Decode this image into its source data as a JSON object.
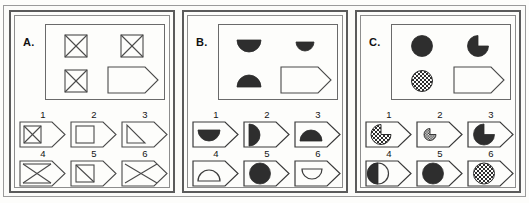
{
  "figure": {
    "type": "matrix-reasoning-test",
    "panel_count": 3,
    "options_per_panel": 6
  },
  "panels": [
    {
      "id": "A",
      "label": "A.",
      "matrix": {
        "cells": [
          {
            "position": "row1-col1",
            "shape": "square-with-x",
            "fill": "outline",
            "size": "medium"
          },
          {
            "position": "row1-col2",
            "shape": "square-with-x",
            "fill": "outline",
            "size": "medium"
          },
          {
            "position": "row2-col1",
            "shape": "square-with-x",
            "fill": "outline",
            "size": "medium"
          },
          {
            "position": "row2-col2",
            "shape": "pentagon-answer-slot",
            "fill": "empty",
            "size": "large"
          }
        ]
      },
      "options": [
        {
          "number": "1",
          "shape": "square-with-x",
          "fill": "outline",
          "size": "small",
          "inside": "pentagon-slot"
        },
        {
          "number": "2",
          "shape": "square-plain",
          "fill": "outline",
          "size": "small",
          "inside": "pentagon-slot"
        },
        {
          "number": "3",
          "shape": "right-triangle",
          "fill": "outline",
          "size": "small",
          "inside": "pentagon-slot"
        },
        {
          "number": "4",
          "shape": "bowtie-x",
          "fill": "outline",
          "size": "large",
          "inside": "pentagon-slot"
        },
        {
          "number": "5",
          "shape": "square-with-diagonal",
          "fill": "outline",
          "size": "small",
          "inside": "pentagon-slot"
        },
        {
          "number": "6",
          "shape": "large-x",
          "fill": "outline",
          "size": "large",
          "inside": "pentagon-slot"
        }
      ]
    },
    {
      "id": "B",
      "label": "B.",
      "matrix": {
        "cells": [
          {
            "position": "row1-col1",
            "shape": "semicircle-lower",
            "fill": "solid",
            "size": "medium"
          },
          {
            "position": "row1-col2",
            "shape": "semicircle-lower",
            "fill": "solid",
            "size": "small"
          },
          {
            "position": "row2-col1",
            "shape": "semicircle-upper",
            "fill": "solid",
            "size": "medium"
          },
          {
            "position": "row2-col2",
            "shape": "pentagon-answer-slot",
            "fill": "empty",
            "size": "large"
          }
        ]
      },
      "options": [
        {
          "number": "1",
          "shape": "semicircle-lower",
          "fill": "solid",
          "size": "small",
          "inside": "pentagon-slot"
        },
        {
          "number": "2",
          "shape": "half-circle-right",
          "fill": "solid",
          "size": "medium",
          "inside": "pentagon-slot"
        },
        {
          "number": "3",
          "shape": "semicircle-upper",
          "fill": "solid",
          "size": "small",
          "inside": "pentagon-slot"
        },
        {
          "number": "4",
          "shape": "semicircle-upper",
          "fill": "outline",
          "size": "small",
          "inside": "pentagon-slot"
        },
        {
          "number": "5",
          "shape": "circle",
          "fill": "solid",
          "size": "medium",
          "inside": "pentagon-slot"
        },
        {
          "number": "6",
          "shape": "semicircle-lower",
          "fill": "outline",
          "size": "small",
          "inside": "pentagon-slot"
        }
      ]
    },
    {
      "id": "C",
      "label": "C.",
      "matrix": {
        "cells": [
          {
            "position": "row1-col1",
            "shape": "circle",
            "fill": "solid",
            "size": "medium"
          },
          {
            "position": "row1-col2",
            "shape": "pacman",
            "fill": "solid",
            "size": "medium"
          },
          {
            "position": "row2-col1",
            "shape": "circle",
            "fill": "checkered",
            "size": "medium"
          },
          {
            "position": "row2-col2",
            "shape": "pentagon-answer-slot",
            "fill": "empty",
            "size": "large"
          }
        ]
      },
      "options": [
        {
          "number": "1",
          "shape": "pacman",
          "fill": "checkered",
          "size": "medium",
          "inside": "pentagon-slot"
        },
        {
          "number": "2",
          "shape": "pacman",
          "fill": "checkered",
          "size": "tiny",
          "inside": "pentagon-slot"
        },
        {
          "number": "3",
          "shape": "pacman",
          "fill": "solid",
          "size": "medium",
          "inside": "pentagon-slot"
        },
        {
          "number": "4",
          "shape": "half-circle-left",
          "fill": "solid",
          "size": "medium",
          "inside": "pentagon-slot"
        },
        {
          "number": "5",
          "shape": "circle",
          "fill": "solid",
          "size": "medium",
          "inside": "pentagon-slot"
        },
        {
          "number": "6",
          "shape": "circle",
          "fill": "checkered",
          "size": "medium",
          "inside": "pentagon-slot"
        }
      ]
    }
  ],
  "colors": {
    "ink": "#2e2e2e",
    "outline": "#4a4a4a",
    "frame": "#5b5b5b",
    "background": "#fdfdfb"
  }
}
